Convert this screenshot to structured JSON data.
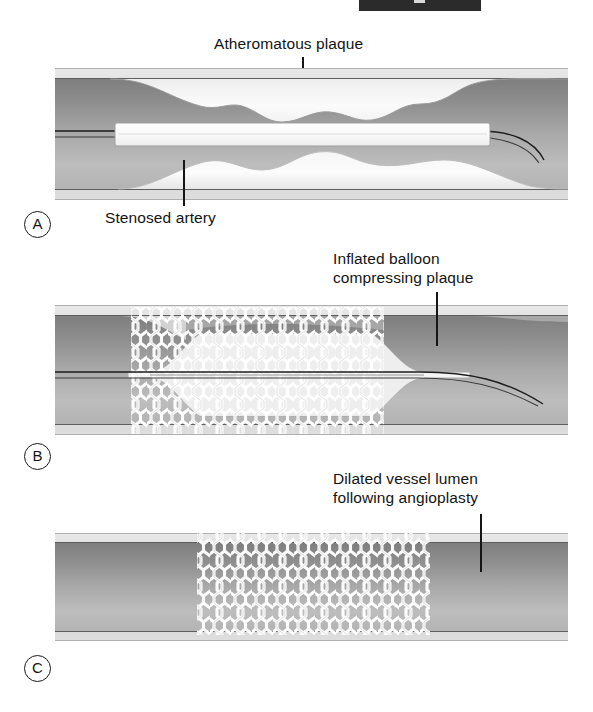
{
  "figure": {
    "type": "medical-illustration",
    "top_bar": {
      "present": true,
      "description": "cropped dark header strip at top edge"
    }
  },
  "panels": [
    {
      "id": "A",
      "letter": "A",
      "labels": [
        {
          "name": "atheromatous-plaque",
          "text": "Atheromatous plaque"
        },
        {
          "name": "stenosed-artery",
          "text": "Stenosed artery"
        }
      ]
    },
    {
      "id": "B",
      "letter": "B",
      "labels": [
        {
          "name": "inflated-balloon",
          "text": "Inflated balloon\ncompressing plaque"
        }
      ]
    },
    {
      "id": "C",
      "letter": "C",
      "labels": [
        {
          "name": "dilated-vessel-lumen",
          "text": "Dilated vessel lumen\nfollowing angioplasty"
        }
      ]
    }
  ],
  "colors": {
    "ink": "#141414",
    "wall_outer": "#cfcfcf",
    "wall_mid": "#9a9a9a",
    "lumen_dark": "#8e8e8e",
    "plaque_light": "#f2f2f2",
    "stent_white": "#ffffff",
    "background": "#ffffff",
    "top_bar": "#2b2b2b"
  }
}
